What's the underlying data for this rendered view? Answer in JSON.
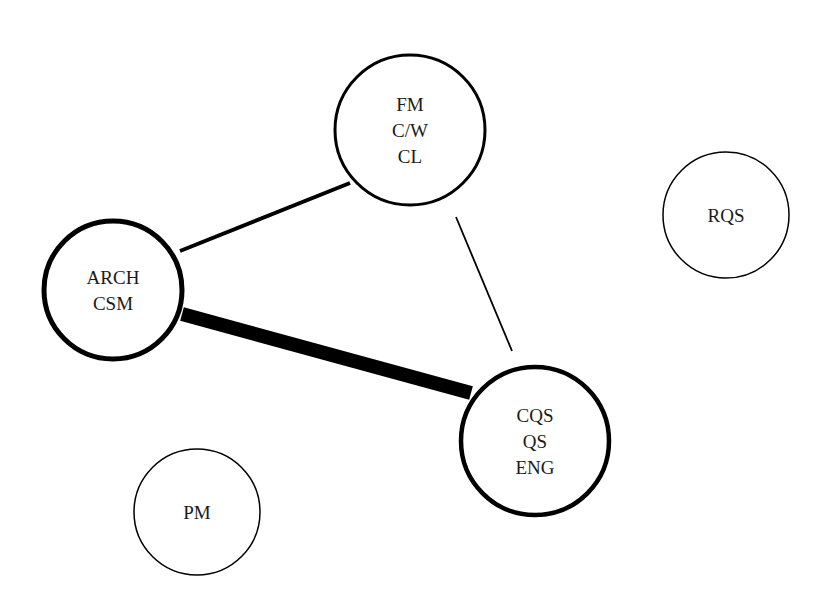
{
  "diagram": {
    "type": "network",
    "background": "#ffffff",
    "stroke_color": "#000000",
    "nodes": [
      {
        "id": "fm",
        "lines": [
          "FM",
          "C/W",
          "CL"
        ],
        "cx": 410,
        "cy": 130,
        "r": 75,
        "stroke_width": 3
      },
      {
        "id": "arch",
        "lines": [
          "ARCH",
          "CSM"
        ],
        "cx": 113,
        "cy": 290,
        "r": 69,
        "stroke_width": 5
      },
      {
        "id": "cqs",
        "lines": [
          "CQS",
          "QS",
          "ENG"
        ],
        "cx": 535,
        "cy": 441,
        "r": 74,
        "stroke_width": 4.5
      },
      {
        "id": "rqs",
        "lines": [
          "RQS"
        ],
        "cx": 726,
        "cy": 215,
        "r": 63,
        "stroke_width": 1.5
      },
      {
        "id": "pm",
        "lines": [
          "PM"
        ],
        "cx": 197,
        "cy": 512,
        "r": 63,
        "stroke_width": 1.5
      }
    ],
    "edges": [
      {
        "from": "arch",
        "to": "fm",
        "strength": "medium",
        "x1": 180,
        "y1": 251,
        "x2": 350,
        "y2": 183,
        "width": 4
      },
      {
        "from": "arch",
        "to": "cqs",
        "strength": "strong",
        "x1": 182,
        "y1": 314,
        "x2": 471,
        "y2": 393,
        "width": 14
      },
      {
        "from": "fm",
        "to": "cqs",
        "strength": "weak",
        "x1": 456,
        "y1": 217,
        "x2": 512,
        "y2": 351,
        "width": 1.8
      }
    ]
  }
}
